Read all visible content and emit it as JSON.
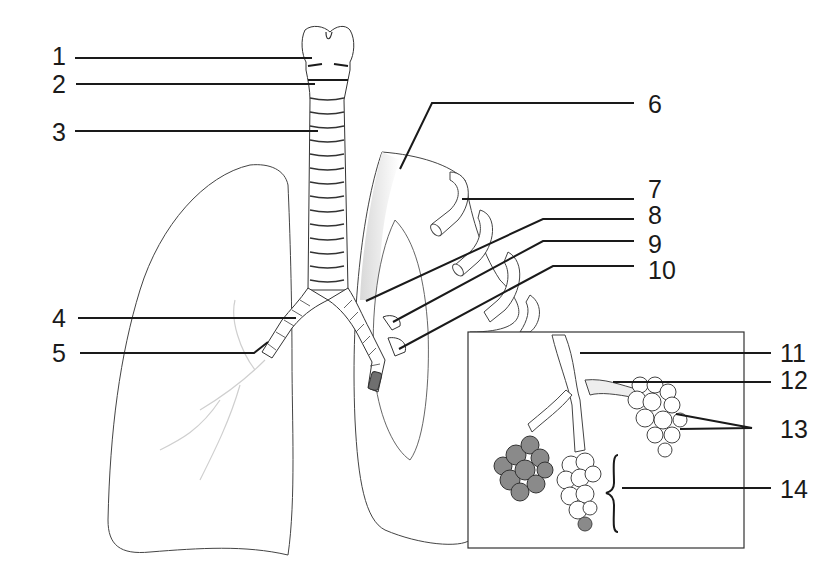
{
  "diagram": {
    "colors": {
      "ink": "#1a1a1a",
      "outline": "#333333",
      "shade": "#bdbdbd",
      "background": "#ffffff"
    },
    "labels": [
      {
        "id": "1",
        "text": "1",
        "x": 52,
        "y": 44
      },
      {
        "id": "2",
        "text": "2",
        "x": 52,
        "y": 72
      },
      {
        "id": "3",
        "text": "3",
        "x": 52,
        "y": 120
      },
      {
        "id": "4",
        "text": "4",
        "x": 52,
        "y": 306
      },
      {
        "id": "5",
        "text": "5",
        "x": 52,
        "y": 341
      },
      {
        "id": "6",
        "text": "6",
        "x": 648,
        "y": 92
      },
      {
        "id": "7",
        "text": "7",
        "x": 648,
        "y": 177
      },
      {
        "id": "8",
        "text": "8",
        "x": 648,
        "y": 203
      },
      {
        "id": "9",
        "text": "9",
        "x": 648,
        "y": 232
      },
      {
        "id": "10",
        "text": "10",
        "x": 648,
        "y": 258
      },
      {
        "id": "11",
        "text": "11",
        "x": 780,
        "y": 341
      },
      {
        "id": "12",
        "text": "12",
        "x": 780,
        "y": 368
      },
      {
        "id": "13",
        "text": "13",
        "x": 780,
        "y": 417
      },
      {
        "id": "14",
        "text": "14",
        "x": 780,
        "y": 477
      }
    ],
    "inset": {
      "title": "Alveoli detail",
      "x": 468,
      "y": 332,
      "w": 276,
      "h": 216
    }
  }
}
